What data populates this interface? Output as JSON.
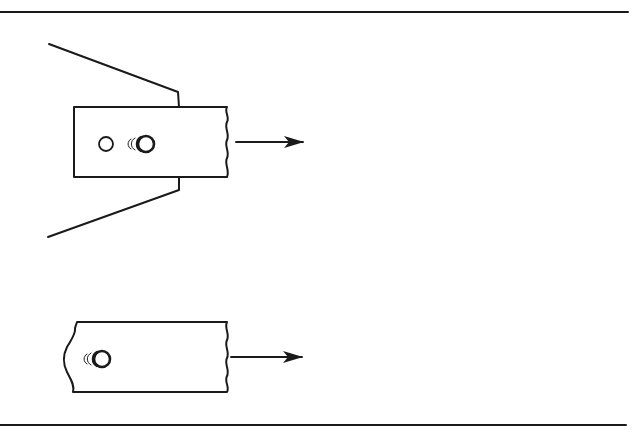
{
  "diagram": {
    "colors": {
      "line": "#1a1a1a",
      "background": "#ffffff"
    },
    "rules": {
      "top": {
        "x1": 0,
        "x2": 628,
        "y": 12
      },
      "bottom": {
        "x1": 0,
        "x2": 626,
        "y": 425
      }
    },
    "upper_figure": {
      "plate": {
        "x": 74,
        "y": 107,
        "right": 227,
        "bottom": 177,
        "right_edge": "broken-wavy"
      },
      "wedge_top": [
        [
          49,
          44
        ],
        [
          178,
          92
        ],
        [
          179,
          107
        ]
      ],
      "wedge_bottom": [
        [
          179,
          177
        ],
        [
          179,
          190
        ],
        [
          48,
          237
        ]
      ],
      "holes": [
        {
          "cx": 106,
          "cy": 144,
          "r": 7,
          "type": "open-circle"
        },
        {
          "cx": 146,
          "cy": 144,
          "r": 8,
          "type": "elongated-hole-with-motion-arcs"
        }
      ],
      "arrow": {
        "x1": 236,
        "x2": 303,
        "y": 142,
        "direction": "right"
      }
    },
    "lower_figure": {
      "plate": {
        "x": 73,
        "y": 322,
        "right": 227,
        "bottom": 392,
        "left_edge": "concave-torn",
        "right_edge": "broken-wavy"
      },
      "holes": [
        {
          "cx": 102,
          "cy": 359,
          "r": 8,
          "type": "elongated-hole-with-motion-arcs"
        }
      ],
      "arrow": {
        "x1": 231,
        "x2": 302,
        "y": 357,
        "direction": "right"
      }
    }
  }
}
